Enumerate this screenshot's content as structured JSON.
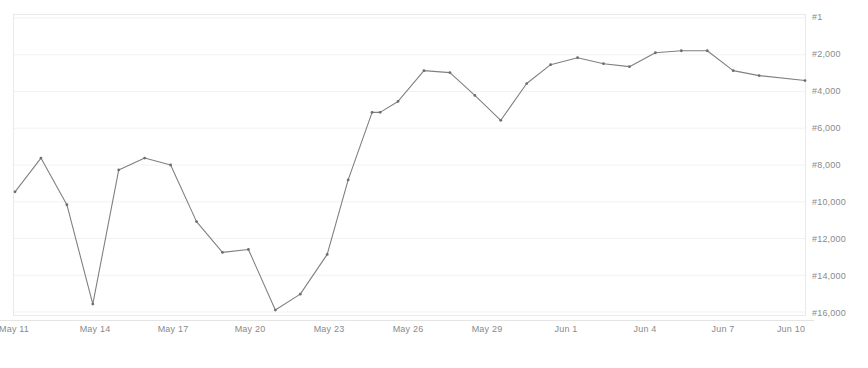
{
  "chart_data": {
    "type": "line",
    "title": "",
    "subtitle": "",
    "xlabel": "",
    "ylabel": "",
    "legend": [],
    "legend_position": "none",
    "grid": true,
    "inverted_yaxis": true,
    "y_tick_labels": [
      "#1",
      "#2,000",
      "#4,000",
      "#6,000",
      "#8,000",
      "#10,000",
      "#12,000",
      "#14,000",
      "#16,000"
    ],
    "y_tick_values": [
      1,
      2000,
      4000,
      6000,
      8000,
      10000,
      12000,
      14000,
      16000
    ],
    "ylim": [
      1,
      16000
    ],
    "x_tick_labels": [
      "May 11",
      "May 14",
      "May 17",
      "May 20",
      "May 23",
      "May 26",
      "May 29",
      "Jun 1",
      "Jun 4",
      "Jun 7",
      "Jun 10"
    ],
    "x": [
      "May 11",
      "May 12",
      "May 13",
      "May 14",
      "May 15",
      "May 16",
      "May 17",
      "May 18",
      "May 19",
      "May 20",
      "May 21",
      "May 22",
      "May 23",
      "May 24",
      "May 25",
      "May 26",
      "May 27",
      "May 28",
      "May 29",
      "May 30",
      "May 31",
      "Jun 1",
      "Jun 2",
      "Jun 3",
      "Jun 4",
      "Jun 5",
      "Jun 6",
      "Jun 7",
      "Jun 8",
      "Jun 9",
      "Jun 10",
      "Jun 11"
    ],
    "series": [
      {
        "name": "Sales Rank",
        "color": "#7a7a7a",
        "values": [
          9500,
          7650,
          10200,
          15620,
          8300,
          7650,
          8030,
          11120,
          12800,
          12650,
          15950,
          15080,
          12900,
          8840,
          5150,
          5150,
          4550,
          2880,
          2990,
          4230,
          5590,
          5590,
          3580,
          2550,
          2170,
          2490,
          2660,
          1900,
          1790,
          1790,
          2880,
          3150
        ]
      }
    ],
    "x_pixel_positions": [
      14,
      40,
      66,
      92,
      118,
      144,
      170,
      196,
      222,
      248,
      275,
      300,
      327,
      348,
      372,
      380,
      398,
      424,
      450,
      475,
      501,
      527,
      551,
      578,
      604,
      630,
      656,
      682,
      708,
      734,
      760,
      806
    ],
    "y_pixel_positions": [
      192,
      158,
      205,
      305,
      170,
      158,
      165,
      222,
      253,
      250,
      311,
      295,
      255,
      180,
      112,
      112,
      101,
      70,
      72,
      95,
      120,
      83,
      64,
      57,
      63,
      66,
      52,
      50,
      50,
      70,
      75,
      80
    ]
  },
  "axis": {
    "y_labels": [
      {
        "text": "#1",
        "top": 12
      },
      {
        "text": "#2,000",
        "top": 49
      },
      {
        "text": "#4,000",
        "top": 86
      },
      {
        "text": "#6,000",
        "top": 123
      },
      {
        "text": "#8,000",
        "top": 160
      },
      {
        "text": "#10,000",
        "top": 197
      },
      {
        "text": "#12,000",
        "top": 234
      },
      {
        "text": "#14,000",
        "top": 271
      },
      {
        "text": "#16,000",
        "top": 308
      }
    ],
    "x_labels": [
      {
        "text": "May 11",
        "left": 14
      },
      {
        "text": "May 14",
        "left": 95
      },
      {
        "text": "May 17",
        "left": 173
      },
      {
        "text": "May 20",
        "left": 250
      },
      {
        "text": "May 23",
        "left": 329
      },
      {
        "text": "May 26",
        "left": 408
      },
      {
        "text": "May 29",
        "left": 487
      },
      {
        "text": "Jun 1",
        "left": 566
      },
      {
        "text": "Jun 4",
        "left": 645
      },
      {
        "text": "Jun 7",
        "left": 723
      },
      {
        "text": "Jun 10",
        "left": 791
      }
    ]
  },
  "colors": {
    "line": "#7a7a7a",
    "marker": "#6e6e6e",
    "grid": "#f2f2f2",
    "frame": "#e9e9e9",
    "text": "#8a8a8a",
    "background": "#ffffff"
  }
}
